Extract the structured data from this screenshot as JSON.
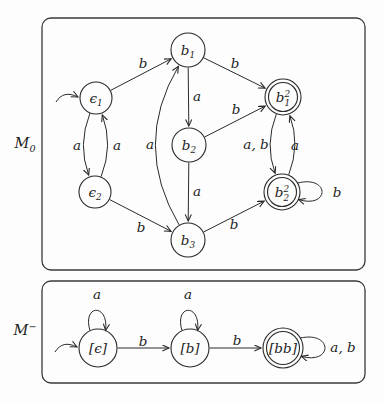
{
  "colors": {
    "ink": "#2a2a2a",
    "paper": "#fdfdfd"
  },
  "machines": [
    {
      "name": "M0",
      "label": {
        "base": "M",
        "sub": "0",
        "sup": "",
        "x": 25,
        "y": 143
      },
      "box": {
        "x": 42,
        "y": 18,
        "w": 323,
        "h": 252,
        "rx": 9
      },
      "states": [
        {
          "id": "e1",
          "base": "ϵ",
          "sub": "1",
          "sup": "",
          "x": 96,
          "y": 98,
          "r": 16,
          "accepting": false,
          "start": true
        },
        {
          "id": "e2",
          "base": "ϵ",
          "sub": "2",
          "sup": "",
          "x": 95,
          "y": 192,
          "r": 16,
          "accepting": false,
          "start": false
        },
        {
          "id": "b1",
          "base": "b",
          "sub": "1",
          "sup": "",
          "x": 188,
          "y": 50,
          "r": 17,
          "accepting": false,
          "start": false
        },
        {
          "id": "b2",
          "base": "b",
          "sub": "2",
          "sup": "",
          "x": 189,
          "y": 145,
          "r": 17,
          "accepting": false,
          "start": false
        },
        {
          "id": "b3",
          "base": "b",
          "sub": "3",
          "sup": "",
          "x": 188,
          "y": 240,
          "r": 17,
          "accepting": false,
          "start": false
        },
        {
          "id": "b12",
          "base": "b",
          "sub": "1",
          "sup": "2",
          "x": 283,
          "y": 97,
          "r": 18,
          "accepting": true,
          "start": false
        },
        {
          "id": "b22",
          "base": "b",
          "sub": "2",
          "sup": "2",
          "x": 282,
          "y": 192,
          "r": 18,
          "accepting": true,
          "start": false
        }
      ],
      "edges": [
        {
          "from": "e1",
          "to": "b1",
          "label": "b",
          "lx": 143,
          "ly": 63,
          "bend": 0
        },
        {
          "from": "e1",
          "to": "e2",
          "label": "a",
          "lx": 77,
          "ly": 145,
          "bend": 18
        },
        {
          "from": "e2",
          "to": "e1",
          "label": "a",
          "lx": 117,
          "ly": 145,
          "bend": 18
        },
        {
          "from": "b1",
          "to": "b2",
          "label": "a",
          "lx": 197,
          "ly": 96,
          "bend": 0
        },
        {
          "from": "b2",
          "to": "b3",
          "label": "a",
          "lx": 197,
          "ly": 191,
          "bend": 0
        },
        {
          "from": "b3",
          "to": "b1",
          "label": "a",
          "lx": 150,
          "ly": 144,
          "bend": -56
        },
        {
          "from": "b1",
          "to": "b12",
          "label": "b",
          "lx": 235,
          "ly": 63,
          "bend": 0
        },
        {
          "from": "b2",
          "to": "b12",
          "label": "b",
          "lx": 236,
          "ly": 109,
          "bend": 0
        },
        {
          "from": "e2",
          "to": "b3",
          "label": "b",
          "lx": 141,
          "ly": 227,
          "bend": 0
        },
        {
          "from": "b3",
          "to": "b22",
          "label": "b",
          "lx": 234,
          "ly": 224,
          "bend": 0
        },
        {
          "from": "b12",
          "to": "b22",
          "label": "a, b",
          "lx": 256,
          "ly": 144,
          "bend": 18
        },
        {
          "from": "b22",
          "to": "b12",
          "label": "a",
          "lx": 295,
          "ly": 145,
          "bend": 18
        },
        {
          "from": "b22",
          "to": "b22",
          "label": "b",
          "lx": 337,
          "ly": 192,
          "loop": "right"
        }
      ]
    },
    {
      "name": "Mminus",
      "label": {
        "base": "M",
        "sub": "",
        "sup": "−",
        "x": 25,
        "y": 330
      },
      "box": {
        "x": 42,
        "y": 281,
        "w": 323,
        "h": 102,
        "rx": 9
      },
      "states": [
        {
          "id": "qe",
          "base": "[ϵ]",
          "sub": "",
          "sup": "",
          "x": 98,
          "y": 348,
          "r": 19,
          "accepting": false,
          "start": true
        },
        {
          "id": "qb",
          "base": "[b]",
          "sub": "",
          "sup": "",
          "x": 190,
          "y": 348,
          "r": 19,
          "accepting": false,
          "start": false
        },
        {
          "id": "qbb",
          "base": "[bb]",
          "sub": "",
          "sup": "",
          "x": 283,
          "y": 348,
          "r": 20,
          "accepting": true,
          "start": false
        }
      ],
      "edges": [
        {
          "from": "qe",
          "to": "qe",
          "label": "a",
          "lx": 97,
          "ly": 294,
          "loop": "top"
        },
        {
          "from": "qb",
          "to": "qb",
          "label": "a",
          "lx": 188,
          "ly": 294,
          "loop": "top"
        },
        {
          "from": "qe",
          "to": "qb",
          "label": "b",
          "lx": 143,
          "ly": 341,
          "bend": 0
        },
        {
          "from": "qb",
          "to": "qbb",
          "label": "b",
          "lx": 237,
          "ly": 340,
          "bend": 0
        },
        {
          "from": "qbb",
          "to": "qbb",
          "label": "a, b",
          "lx": 343,
          "ly": 347,
          "loop": "right"
        }
      ]
    }
  ]
}
